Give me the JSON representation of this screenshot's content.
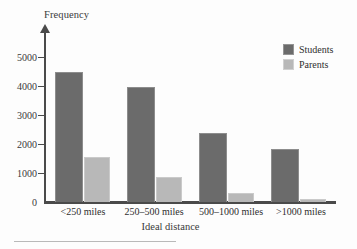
{
  "chart_data": {
    "type": "bar",
    "title": "",
    "xlabel": "Ideal distance",
    "ylabel": "Frequency",
    "categories": [
      "<250 miles",
      "250–500 miles",
      "500–1000 miles",
      ">1000 miles"
    ],
    "series": [
      {
        "name": "Students",
        "values": [
          4450,
          3950,
          2350,
          1830
        ],
        "color": "#6b6b6b"
      },
      {
        "name": "Parents",
        "values": [
          1550,
          850,
          300,
          100
        ],
        "color": "#b8b8b8"
      }
    ],
    "ylim": [
      0,
      5000
    ],
    "yticks": [
      0,
      1000,
      2000,
      3000,
      4000,
      5000
    ],
    "ytick_labels": [
      "0",
      "1000",
      "2000",
      "3000",
      "4000",
      "5000"
    ],
    "grid": false,
    "legend_position": "top-right",
    "legend": [
      "Students",
      "Parents"
    ],
    "axis_color": "#4a4a4a",
    "background": "#fdfdfd"
  },
  "axes": {
    "y_title": "Frequency",
    "x_title": "Ideal distance"
  },
  "legend": {
    "entries": [
      {
        "label": "Students",
        "swatch": "students-swatch"
      },
      {
        "label": "Parents",
        "swatch": "parents-swatch"
      }
    ]
  }
}
